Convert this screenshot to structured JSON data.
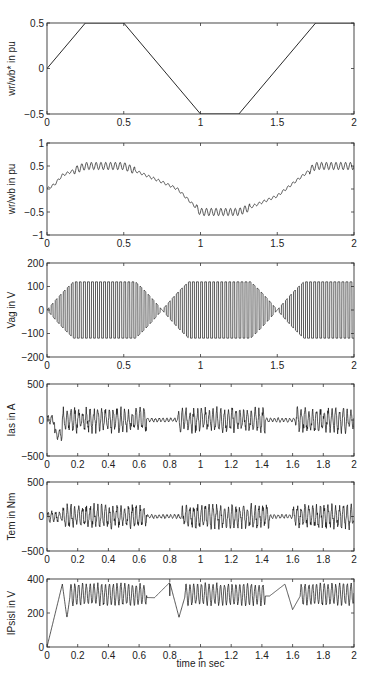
{
  "figure": {
    "xlabel": "time in sec"
  },
  "chart_data": [
    {
      "type": "line",
      "title": "",
      "ylabel": "wr/wb* in pu",
      "xlabel": "",
      "xlim": [
        0,
        2
      ],
      "ylim": [
        -0.5,
        0.5
      ],
      "xticks": [
        "0",
        "0.5",
        "1",
        "1.5",
        "2"
      ],
      "yticks": [
        "-0.5",
        "0",
        "0.5"
      ],
      "box": {
        "top": 23,
        "bottom": 114
      },
      "series": [
        {
          "name": "speed reference",
          "x": [
            0,
            0.25,
            0.5,
            1.0,
            1.25,
            1.75,
            2.0
          ],
          "y": [
            0,
            0.5,
            0.5,
            -0.5,
            -0.5,
            0.5,
            0.5
          ]
        }
      ]
    },
    {
      "type": "line",
      "title": "",
      "ylabel": "wr/wb in pu",
      "xlabel": "",
      "xlim": [
        0,
        2
      ],
      "ylim": [
        -1,
        1
      ],
      "xticks": [
        "0",
        "0.5",
        "1",
        "1.5",
        "2"
      ],
      "yticks": [
        "-1",
        "-0.5",
        "0",
        "0.5",
        "1"
      ],
      "box": {
        "top": 143,
        "bottom": 235
      },
      "series": [
        {
          "name": "rotor speed",
          "envelope_x": [
            0,
            0.05,
            0.1,
            0.25,
            0.5,
            0.75,
            0.85,
            1.0,
            1.25,
            1.5,
            1.65,
            1.75,
            2.0
          ],
          "envelope_y": [
            0,
            0.1,
            0.3,
            0.5,
            0.5,
            0.15,
            0.0,
            -0.5,
            -0.5,
            -0.15,
            0.25,
            0.5,
            0.5
          ],
          "ripple_amplitude": 0.08
        }
      ]
    },
    {
      "type": "line",
      "title": "",
      "ylabel": "Vag in V",
      "xlabel": "",
      "xlim": [
        0,
        2
      ],
      "ylim": [
        -200,
        200
      ],
      "xticks": [
        "0",
        "0.5",
        "1",
        "1.5",
        "2"
      ],
      "yticks": [
        "-200",
        "-100",
        "0",
        "100",
        "200"
      ],
      "box": {
        "top": 263,
        "bottom": 357
      },
      "series": [
        {
          "name": "phase voltage (PWM)",
          "peak_amplitude": 120,
          "envelope_max_at": [
            0.35,
            1.1,
            1.85
          ],
          "envelope_zero_at": [
            0.75,
            1.5
          ]
        }
      ]
    },
    {
      "type": "line",
      "title": "",
      "ylabel": "Ias in A",
      "xlabel": "",
      "xlim": [
        0,
        2
      ],
      "ylim": [
        -500,
        500
      ],
      "xticks": [
        "0",
        "0.2",
        "0.4",
        "0.6",
        "0.8",
        "1",
        "1.2",
        "1.4",
        "1.6",
        "1.8",
        "2"
      ],
      "yticks": [
        "-500",
        "0",
        "500"
      ],
      "box": {
        "top": 384,
        "bottom": 456
      },
      "series": [
        {
          "name": "stator current",
          "min_approx": -270,
          "max_approx": 250,
          "typical_band": [
            -200,
            200
          ]
        }
      ]
    },
    {
      "type": "line",
      "title": "",
      "ylabel": "Tem in Nm",
      "xlabel": "",
      "xlim": [
        0,
        2
      ],
      "ylim": [
        -500,
        500
      ],
      "xticks": [
        "0",
        "0.2",
        "0.4",
        "0.6",
        "0.8",
        "1",
        "1.2",
        "1.4",
        "1.6",
        "1.8",
        "2"
      ],
      "yticks": [
        "-500",
        "0",
        "500"
      ],
      "box": {
        "top": 482,
        "bottom": 551
      },
      "series": [
        {
          "name": "electromagnetic torque",
          "min_approx": -280,
          "max_approx": 280,
          "typical_band": [
            -250,
            180
          ]
        }
      ]
    },
    {
      "type": "line",
      "title": "",
      "ylabel": "IPsisI in V",
      "xlabel": "time in sec",
      "xlim": [
        0,
        2
      ],
      "ylim": [
        0,
        400
      ],
      "xticks": [
        "0",
        "0.2",
        "0.4",
        "0.6",
        "0.8",
        "1",
        "1.2",
        "1.4",
        "1.6",
        "1.8",
        "2"
      ],
      "yticks": [
        "0",
        "200",
        "400"
      ],
      "box": {
        "top": 579,
        "bottom": 647
      },
      "series": [
        {
          "name": "stator flux magnitude",
          "x": [
            0,
            0.1,
            0.13,
            0.15,
            0.7,
            0.8,
            0.86,
            0.9,
            1.45,
            1.55,
            1.6,
            1.65,
            2.0
          ],
          "y": [
            0,
            370,
            170,
            300,
            290,
            380,
            175,
            300,
            300,
            370,
            220,
            300,
            300
          ],
          "ripple_band": [
            240,
            380
          ]
        }
      ]
    }
  ]
}
